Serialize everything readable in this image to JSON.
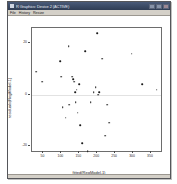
{
  "window": {
    "title": "R Graphics: Device 2 (ACTIVE)",
    "icon": "chart-icon",
    "buttons": {
      "minimize": "_",
      "maximize": "□",
      "close": "×"
    },
    "menus": [
      {
        "label": "File"
      },
      {
        "label": "History"
      },
      {
        "label": "Resize"
      }
    ]
  },
  "chart_data": {
    "type": "scatter",
    "title": "",
    "xlabel": "fitted(RegModel.1)",
    "ylabel": "residuals(RegModel.1)",
    "xlim": [
      18,
      378
    ],
    "ylim": [
      -22,
      26
    ],
    "xticks": [
      50,
      100,
      150,
      200,
      250,
      300,
      350
    ],
    "yticks": [
      20,
      0,
      -20
    ],
    "ytick_labels": [
      "20",
      "0",
      "-20"
    ],
    "grid": false,
    "legend": null,
    "reference_line": {
      "y": 0,
      "color": "#e2e2e2"
    },
    "marker": {
      "shape": "circle",
      "color": "#1a1a1a",
      "size": 1.6
    },
    "points": [
      {
        "x": 30,
        "y": 9
      },
      {
        "x": 46,
        "y": 5
      },
      {
        "x": 96,
        "y": 13
      },
      {
        "x": 100,
        "y": 7
      },
      {
        "x": 104,
        "y": -5
      },
      {
        "x": 112,
        "y": -9
      },
      {
        "x": 120,
        "y": 19
      },
      {
        "x": 122,
        "y": -4
      },
      {
        "x": 131,
        "y": 7
      },
      {
        "x": 133,
        "y": 6
      },
      {
        "x": 136,
        "y": 5
      },
      {
        "x": 138,
        "y": 1
      },
      {
        "x": 140,
        "y": -3
      },
      {
        "x": 143,
        "y": 2
      },
      {
        "x": 146,
        "y": -7
      },
      {
        "x": 150,
        "y": 4
      },
      {
        "x": 152,
        "y": -12
      },
      {
        "x": 158,
        "y": -19
      },
      {
        "x": 166,
        "y": 17
      },
      {
        "x": 174,
        "y": -22
      },
      {
        "x": 182,
        "y": -3
      },
      {
        "x": 190,
        "y": 1
      },
      {
        "x": 196,
        "y": 3
      },
      {
        "x": 200,
        "y": 24
      },
      {
        "x": 202,
        "y": 0
      },
      {
        "x": 206,
        "y": 1
      },
      {
        "x": 214,
        "y": 14
      },
      {
        "x": 222,
        "y": -16
      },
      {
        "x": 228,
        "y": -4
      },
      {
        "x": 234,
        "y": -11
      },
      {
        "x": 296,
        "y": 16
      },
      {
        "x": 326,
        "y": 4
      },
      {
        "x": 366,
        "y": 2
      }
    ]
  }
}
